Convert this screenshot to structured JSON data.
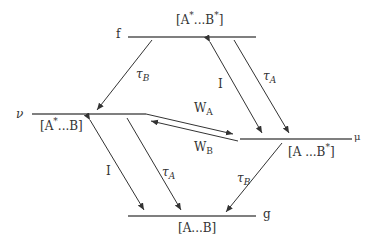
{
  "diagram": {
    "type": "energy-level transfer diagram",
    "levels": {
      "f": {
        "name": "f",
        "state_prefix": "[A",
        "state_mid": "...B",
        "state_end": "]",
        "sup1": "*",
        "sup2": "*"
      },
      "nu": {
        "name": "ν",
        "state_prefix": "[A",
        "state_mid": "...B]",
        "sup1": "*"
      },
      "mu": {
        "name": "μ",
        "state_prefix": "[A ...B",
        "state_end": "]",
        "sup1": "*"
      },
      "g": {
        "name": "g",
        "state": "[A...B]"
      }
    },
    "transitions": [
      {
        "from": "f",
        "to": "nu",
        "label": "τ",
        "sub": "B"
      },
      {
        "from": "f",
        "to": "mu",
        "label": "I",
        "bidirectional": true
      },
      {
        "from": "f",
        "to": "mu",
        "label": "τ",
        "sub": "A",
        "id": "tauA_top"
      },
      {
        "from": "nu",
        "to": "mu",
        "label": "W",
        "sub": "A"
      },
      {
        "from": "mu",
        "to": "nu",
        "label": "W",
        "sub": "B"
      },
      {
        "from": "nu",
        "to": "g",
        "label": "I",
        "bidirectional": true
      },
      {
        "from": "nu",
        "to": "g",
        "label": "τ",
        "sub": "A",
        "id": "tauA_bottom"
      },
      {
        "from": "mu",
        "to": "g",
        "label": "τ",
        "sub": "B",
        "id": "tauB_bottom"
      }
    ]
  }
}
